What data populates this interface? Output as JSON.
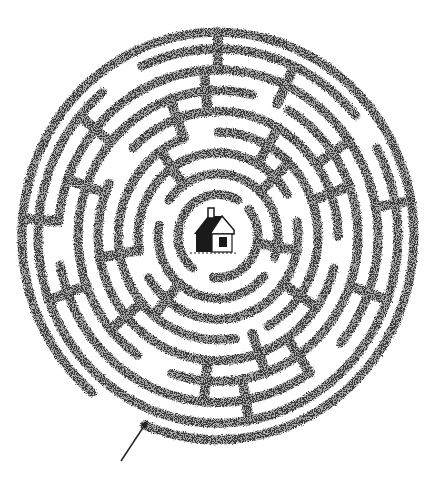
{
  "puzzle": {
    "type": "circular-maze",
    "title": "Circular hedge maze",
    "goal_label": "house",
    "entrance_label": "entrance-arrow",
    "colors": {
      "background": "#ffffff",
      "hedge": "#3a3a3a",
      "hedge_light": "#6a6a6a",
      "house": "#1a1a1a"
    },
    "center": {
      "x": 218,
      "y": 236
    },
    "scale_y": 1.04,
    "wall_width": 9,
    "rings": [
      {
        "r": 40,
        "gaps": [
          [
            100,
            130
          ],
          [
            300,
            320
          ]
        ]
      },
      {
        "r": 60,
        "gaps": [
          [
            20,
            40
          ],
          [
            190,
            215
          ]
        ]
      },
      {
        "r": 80,
        "gaps": [
          [
            150,
            170
          ],
          [
            330,
            350
          ]
        ]
      },
      {
        "r": 100,
        "gaps": [
          [
            60,
            80
          ],
          [
            250,
            270
          ]
        ]
      },
      {
        "r": 120,
        "gaps": [
          [
            0,
            15
          ],
          [
            205,
            225
          ]
        ]
      },
      {
        "r": 140,
        "gaps": [
          [
            110,
            125
          ],
          [
            285,
            300
          ]
        ]
      },
      {
        "r": 160,
        "gaps": [
          [
            40,
            55
          ],
          [
            170,
            185
          ]
        ]
      },
      {
        "r": 180,
        "gaps": [
          [
            230,
            245
          ],
          [
            320,
            332
          ]
        ]
      },
      {
        "r": 196,
        "gaps": [
          [
            112,
            130
          ]
        ]
      }
    ],
    "spokes": [
      {
        "a": 270,
        "r1": 160,
        "r2": 196
      },
      {
        "a": 265,
        "r1": 120,
        "r2": 160
      },
      {
        "a": 295,
        "r1": 140,
        "r2": 180
      },
      {
        "a": 250,
        "r1": 100,
        "r2": 140
      },
      {
        "a": 300,
        "r1": 80,
        "r2": 120
      },
      {
        "a": 235,
        "r1": 60,
        "r2": 100
      },
      {
        "a": 220,
        "r1": 140,
        "r2": 180
      },
      {
        "a": 200,
        "r1": 120,
        "r2": 160
      },
      {
        "a": 185,
        "r1": 160,
        "r2": 196
      },
      {
        "a": 170,
        "r1": 80,
        "r2": 120
      },
      {
        "a": 160,
        "r1": 140,
        "r2": 180
      },
      {
        "a": 140,
        "r1": 100,
        "r2": 140
      },
      {
        "a": 130,
        "r1": 60,
        "r2": 100
      },
      {
        "a": 95,
        "r1": 120,
        "r2": 160
      },
      {
        "a": 80,
        "r1": 140,
        "r2": 180
      },
      {
        "a": 70,
        "r1": 100,
        "r2": 140
      },
      {
        "a": 55,
        "r1": 120,
        "r2": 160
      },
      {
        "a": 35,
        "r1": 80,
        "r2": 120
      },
      {
        "a": 20,
        "r1": 140,
        "r2": 180
      },
      {
        "a": 10,
        "r1": 40,
        "r2": 80
      },
      {
        "a": 350,
        "r1": 160,
        "r2": 196
      },
      {
        "a": 340,
        "r1": 100,
        "r2": 140
      },
      {
        "a": 325,
        "r1": 120,
        "r2": 160
      },
      {
        "a": 315,
        "r1": 60,
        "r2": 100
      }
    ],
    "arrow": {
      "x1": 121,
      "y1": 461,
      "x2": 148,
      "y2": 420
    }
  }
}
